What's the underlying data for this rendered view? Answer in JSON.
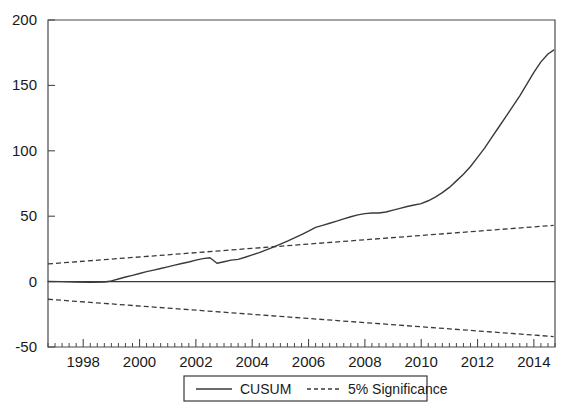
{
  "chart_data": {
    "type": "line",
    "title": "",
    "subtitle": "",
    "xlabel": "",
    "ylabel": "",
    "xlim": [
      1996.75,
      2014.75
    ],
    "ylim": [
      -50,
      200
    ],
    "grid": false,
    "legend_position": "bottom-center",
    "y_ticks": [
      -50,
      0,
      50,
      100,
      150,
      200
    ],
    "y_tick_labels": [
      "-50",
      "0",
      "50",
      "100",
      "150",
      "200"
    ],
    "x_ticks": [
      1998,
      2000,
      2002,
      2004,
      2006,
      2008,
      2010,
      2012,
      2014
    ],
    "x_tick_labels": [
      "1998",
      "2000",
      "2002",
      "2004",
      "2006",
      "2008",
      "2010",
      "2012",
      "2014"
    ],
    "x_minor_tick_step": 0.25,
    "zero_line": 0,
    "series": [
      {
        "name": "CUSUM",
        "style": "solid",
        "color": "#3a3a3a",
        "x": [
          1996.75,
          1997.25,
          1997.75,
          1998.25,
          1998.75,
          1999.0,
          1999.25,
          1999.5,
          1999.75,
          2000.0,
          2000.25,
          2000.5,
          2000.75,
          2001.0,
          2001.25,
          2001.5,
          2001.75,
          2002.0,
          2002.25,
          2002.5,
          2002.75,
          2003.0,
          2003.25,
          2003.5,
          2003.75,
          2004.0,
          2004.25,
          2004.5,
          2004.75,
          2005.0,
          2005.25,
          2005.5,
          2005.75,
          2006.0,
          2006.25,
          2006.5,
          2006.75,
          2007.0,
          2007.25,
          2007.5,
          2007.75,
          2008.0,
          2008.25,
          2008.5,
          2008.75,
          2009.0,
          2009.25,
          2009.5,
          2009.75,
          2010.0,
          2010.25,
          2010.5,
          2010.75,
          2011.0,
          2011.25,
          2011.5,
          2011.75,
          2012.0,
          2012.25,
          2012.5,
          2012.75,
          2013.0,
          2013.25,
          2013.5,
          2013.75,
          2014.0,
          2014.25,
          2014.5,
          2014.7
        ],
        "y": [
          0.2,
          0.0,
          -0.4,
          -0.6,
          -0.3,
          0.5,
          2.0,
          3.5,
          4.8,
          6.2,
          7.6,
          8.8,
          10.0,
          11.3,
          12.6,
          13.8,
          15.0,
          16.4,
          17.6,
          18.2,
          14.0,
          15.2,
          16.4,
          17.0,
          18.6,
          20.4,
          22.2,
          24.2,
          26.4,
          28.6,
          31.0,
          33.4,
          36.0,
          38.6,
          41.4,
          43.0,
          44.6,
          46.2,
          48.0,
          49.6,
          51.0,
          52.0,
          52.4,
          52.4,
          53.2,
          54.6,
          56.0,
          57.4,
          58.6,
          59.6,
          61.8,
          64.6,
          68.0,
          72.0,
          77.0,
          82.0,
          88.0,
          95.0,
          102.0,
          110.0,
          118.0,
          126.0,
          134.0,
          142.0,
          151.0,
          160.0,
          168.0,
          174.0,
          177.0
        ]
      },
      {
        "name": "5% Significance",
        "style": "dashed",
        "color": "#3a3a3a",
        "bound": "upper",
        "x": [
          1996.75,
          2014.7
        ],
        "y": [
          13.5,
          43.0
        ]
      },
      {
        "name": "5% Significance",
        "style": "dashed",
        "color": "#3a3a3a",
        "bound": "lower",
        "x": [
          1996.75,
          2014.7
        ],
        "y": [
          -13.5,
          -42.0
        ]
      }
    ],
    "legend": [
      {
        "label": "CUSUM",
        "style": "solid"
      },
      {
        "label": "5% Significance",
        "style": "dashed"
      }
    ]
  }
}
